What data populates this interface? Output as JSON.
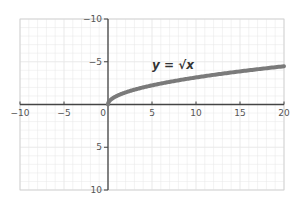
{
  "chart_data": {
    "type": "line",
    "title": "",
    "annotation": "y = √x",
    "xlabel": "",
    "ylabel": "",
    "xlim": [
      -10,
      20
    ],
    "ylim": [
      -10,
      10
    ],
    "x_ticks": [
      -10,
      -5,
      0,
      5,
      10,
      15,
      20
    ],
    "y_ticks": [
      -10,
      -5,
      5,
      10
    ],
    "grid": true,
    "series": [
      {
        "name": "y = √x",
        "color": "#7a7a7a",
        "x": [
          0,
          0.25,
          1,
          2,
          4,
          6,
          9,
          12,
          16,
          20
        ],
        "y": [
          0,
          0.5,
          1,
          1.414,
          2,
          2.449,
          3,
          3.464,
          4,
          4.472
        ]
      }
    ]
  },
  "labels": {
    "x_ticks": [
      "−10",
      "−5",
      "0",
      "5",
      "10",
      "15",
      "20"
    ],
    "y_ticks": [
      "10",
      "5",
      "−5",
      "−10"
    ],
    "equation": "y = √x"
  },
  "colors": {
    "grid": "#e6e6e6",
    "axis": "#444444",
    "curve": "#7a7a7a"
  }
}
